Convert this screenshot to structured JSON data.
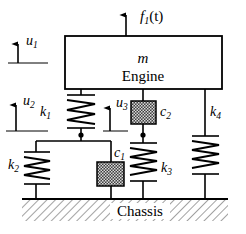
{
  "diagram": {
    "title_text": "Engine mount vibration model",
    "mass": {
      "symbol": "m",
      "name": "Engine"
    },
    "force": {
      "label": "f",
      "subscript": "1",
      "argument": "(t)",
      "direction": "up"
    },
    "displacements": [
      {
        "id": "u1",
        "label": "u",
        "subscript": "1",
        "direction": "up"
      },
      {
        "id": "u2",
        "label": "u",
        "subscript": "2",
        "direction": "up"
      },
      {
        "id": "u3",
        "label": "u",
        "subscript": "3",
        "direction": "up"
      }
    ],
    "springs": [
      {
        "id": "k1",
        "label": "k",
        "subscript": "1"
      },
      {
        "id": "k2",
        "label": "k",
        "subscript": "2"
      },
      {
        "id": "k3",
        "label": "k",
        "subscript": "3"
      },
      {
        "id": "k4",
        "label": "k",
        "subscript": "4"
      }
    ],
    "dampers": [
      {
        "id": "c1",
        "label": "c",
        "subscript": "1"
      },
      {
        "id": "c2",
        "label": "c",
        "subscript": "2"
      }
    ],
    "ground": {
      "label": "Chassis"
    },
    "colors": {
      "line": "#000000",
      "background": "#ffffff",
      "damper_fill": "#4a4a4a",
      "ground_hatch": "#555555"
    }
  }
}
